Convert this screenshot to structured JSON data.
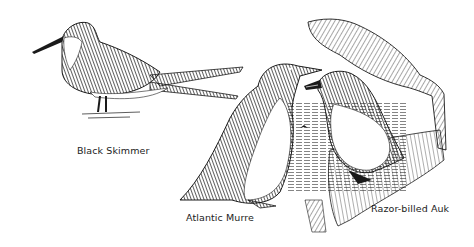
{
  "illustration": {
    "style": "pen-and-ink sketch",
    "colors": {
      "ink": "#1a1a1a",
      "paper": "#ffffff"
    },
    "birds": [
      {
        "name": "Black Skimmer",
        "caption": "Black Skimmer"
      },
      {
        "name": "Atlantic Murre",
        "caption": "Atlantic Murre"
      },
      {
        "name": "Razor-billed Auk",
        "caption": "Razor-billed Auk"
      }
    ]
  }
}
